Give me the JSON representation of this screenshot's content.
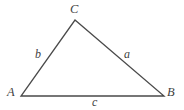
{
  "figure": {
    "type": "geometry-diagram",
    "shape": "triangle",
    "background_color": "#ffffff",
    "stroke_color": "#4a4a4a",
    "text_color": "#3f3f3f",
    "stroke_width": 1.3,
    "width": 184,
    "height": 110
  },
  "vertices": [
    {
      "key": "A",
      "label": "A",
      "x": 21,
      "y": 96
    },
    {
      "key": "B",
      "label": "B",
      "x": 164,
      "y": 96
    },
    {
      "key": "C",
      "label": "C",
      "x": 75,
      "y": 20
    }
  ],
  "sides": [
    {
      "key": "a",
      "label": "a",
      "from": "C",
      "to": "B",
      "opposite_vertex": "A"
    },
    {
      "key": "b",
      "label": "b",
      "from": "A",
      "to": "C",
      "opposite_vertex": "B"
    },
    {
      "key": "c",
      "label": "c",
      "from": "A",
      "to": "B",
      "opposite_vertex": "C"
    }
  ],
  "labels": {
    "vertex_A": "A",
    "vertex_B": "B",
    "vertex_C": "C",
    "side_a": "a",
    "side_b": "b",
    "side_c": "c"
  }
}
